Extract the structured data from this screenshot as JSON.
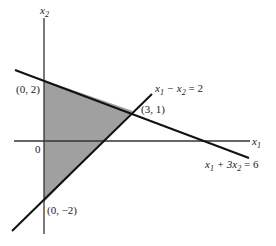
{
  "diagram": {
    "type": "linear-programming-feasible-region",
    "axes": {
      "x_label": "x",
      "x_sub": "1",
      "y_label": "x",
      "y_sub": "2",
      "origin_label": "0"
    },
    "lines": [
      {
        "name": "x1 - x2 = 2",
        "label_parts": [
          "x",
          "1",
          " − x",
          "2",
          " = 2"
        ]
      },
      {
        "name": "x1 + 3x2 = 6",
        "label_parts": [
          "x",
          "1",
          " + 3x",
          "2",
          " = 6"
        ]
      }
    ],
    "vertices": [
      {
        "label": "(0, 2)"
      },
      {
        "label": "(3, 1)"
      },
      {
        "label": "(0, −2)"
      }
    ],
    "region_fill": "#9a9a9a",
    "line_color": "#111111"
  }
}
